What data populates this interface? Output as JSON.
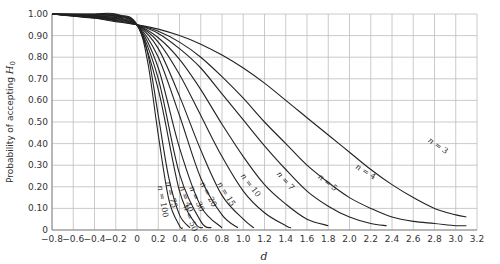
{
  "chart_data": {
    "type": "line",
    "title": "",
    "xlabel": "d",
    "ylabel": "Probability of accepting H0",
    "ylabel_parts": {
      "text": "Probability of accepting ",
      "var": "H",
      "sub": "0"
    },
    "xlim": [
      -0.8,
      3.2
    ],
    "ylim": [
      0,
      1.0
    ],
    "grid": true,
    "legend": "none (curves labeled inline)",
    "x_ticks": [
      "−0.8",
      "−0.6",
      "−0.4",
      "−0.2",
      "0",
      "0.2",
      "0.4",
      "0.6",
      "0.8",
      "1.0",
      "1.2",
      "1.4",
      "1.6",
      "1.8",
      "2.0",
      "2.2",
      "2.4",
      "2.6",
      "2.8",
      "3.0",
      "3.2"
    ],
    "y_ticks": [
      "0",
      "0.10",
      "0.20",
      "0.30",
      "0.40",
      "0.50",
      "0.60",
      "0.70",
      "0.80",
      "0.90",
      "1.00"
    ],
    "series": [
      {
        "name": "n = 3",
        "label": "n = 3",
        "label_pos": [
          2.82,
          0.38
        ],
        "label_rot": 35,
        "x": [
          0,
          0.2,
          0.4,
          0.6,
          0.8,
          1.0,
          1.2,
          1.4,
          1.6,
          1.8,
          2.0,
          2.2,
          2.4,
          2.6,
          2.8,
          3.0,
          3.1
        ],
        "y": [
          0.95,
          0.93,
          0.9,
          0.86,
          0.81,
          0.75,
          0.68,
          0.6,
          0.52,
          0.44,
          0.36,
          0.28,
          0.21,
          0.15,
          0.1,
          0.07,
          0.06
        ]
      },
      {
        "name": "n = 4",
        "label": "n = 4",
        "label_pos": [
          2.14,
          0.26
        ],
        "label_rot": 32,
        "x": [
          0,
          0.2,
          0.4,
          0.6,
          0.8,
          1.0,
          1.2,
          1.4,
          1.6,
          1.8,
          2.0,
          2.2,
          2.4,
          2.6,
          2.8,
          3.0,
          3.1
        ],
        "y": [
          0.95,
          0.92,
          0.87,
          0.8,
          0.71,
          0.61,
          0.5,
          0.4,
          0.3,
          0.22,
          0.15,
          0.1,
          0.06,
          0.04,
          0.03,
          0.02,
          0.02
        ]
      },
      {
        "name": "n = 5",
        "label": "n = 5",
        "label_pos": [
          1.78,
          0.21
        ],
        "label_rot": 38,
        "x": [
          0,
          0.2,
          0.4,
          0.6,
          0.8,
          1.0,
          1.2,
          1.4,
          1.6,
          1.8,
          2.0,
          2.2,
          2.35
        ],
        "y": [
          0.95,
          0.91,
          0.84,
          0.75,
          0.63,
          0.51,
          0.39,
          0.28,
          0.18,
          0.11,
          0.06,
          0.03,
          0.02
        ]
      },
      {
        "name": "n = 7",
        "label": "n = 7",
        "label_pos": [
          1.38,
          0.22
        ],
        "label_rot": 48,
        "x": [
          0,
          0.2,
          0.4,
          0.6,
          0.8,
          1.0,
          1.2,
          1.4,
          1.6,
          1.8
        ],
        "y": [
          0.95,
          0.89,
          0.79,
          0.65,
          0.49,
          0.34,
          0.21,
          0.12,
          0.05,
          0.02
        ]
      },
      {
        "name": "n = 10",
        "label": "n = 10",
        "label_pos": [
          1.05,
          0.2
        ],
        "label_rot": 52,
        "x": [
          0,
          0.2,
          0.4,
          0.6,
          0.8,
          1.0,
          1.2,
          1.4,
          1.45
        ],
        "y": [
          0.95,
          0.87,
          0.72,
          0.53,
          0.34,
          0.18,
          0.08,
          0.02,
          0.01
        ]
      },
      {
        "name": "n = 15",
        "label": "n = 15",
        "label_pos": [
          0.82,
          0.16
        ],
        "label_rot": 58,
        "x": [
          0,
          0.2,
          0.4,
          0.6,
          0.8,
          1.0,
          1.1
        ],
        "y": [
          0.95,
          0.84,
          0.62,
          0.37,
          0.16,
          0.05,
          0.01
        ]
      },
      {
        "name": "n = 20",
        "label": "n = 20",
        "label_pos": [
          0.65,
          0.16
        ],
        "label_rot": 62,
        "x": [
          0,
          0.2,
          0.4,
          0.6,
          0.8,
          0.95
        ],
        "y": [
          0.95,
          0.8,
          0.53,
          0.24,
          0.07,
          0.01
        ]
      },
      {
        "name": "n = 30",
        "label": "n = 30",
        "label_pos": [
          0.54,
          0.14
        ],
        "label_rot": 66,
        "x": [
          0,
          0.2,
          0.4,
          0.6,
          0.8
        ],
        "y": [
          0.95,
          0.75,
          0.38,
          0.11,
          0.01
        ]
      },
      {
        "name": "n = 40",
        "label": "n = 40",
        "label_pos": [
          0.44,
          0.14
        ],
        "label_rot": 70,
        "x": [
          0,
          0.2,
          0.4,
          0.6,
          0.7
        ],
        "y": [
          0.95,
          0.7,
          0.26,
          0.04,
          0.01
        ]
      },
      {
        "name": "n = 50",
        "label": "n = 50",
        "label_pos": [
          0.48,
          0.05
        ],
        "label_rot": 70,
        "x": [
          0,
          0.2,
          0.4,
          0.55,
          0.62
        ],
        "y": [
          0.95,
          0.65,
          0.18,
          0.03,
          0.01
        ]
      },
      {
        "name": "n = 75",
        "label": "n = 75",
        "label_pos": [
          0.3,
          0.16
        ],
        "label_rot": 75,
        "x": [
          0,
          0.1,
          0.2,
          0.3,
          0.4,
          0.5
        ],
        "y": [
          0.95,
          0.82,
          0.53,
          0.24,
          0.07,
          0.01
        ]
      },
      {
        "name": "n = 100",
        "label": "n = 100",
        "label_pos": [
          0.22,
          0.13
        ],
        "label_rot": 80,
        "x": [
          0,
          0.1,
          0.2,
          0.3,
          0.4,
          0.43
        ],
        "y": [
          0.95,
          0.78,
          0.44,
          0.14,
          0.02,
          0.01
        ]
      }
    ],
    "negative_side": {
      "note": "mirror curves for d < 0 rising from 0.95 at d=0 to 1.00 at d≈-0.8",
      "x": [
        -0.8,
        -0.6,
        -0.4,
        -0.2,
        0
      ],
      "y_upper": [
        1.0,
        1.0,
        1.0,
        1.0,
        0.95
      ],
      "y_lower": [
        1.0,
        0.99,
        0.98,
        0.965,
        0.95
      ]
    }
  }
}
